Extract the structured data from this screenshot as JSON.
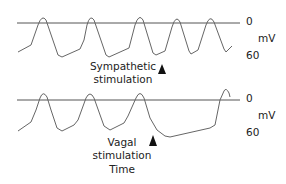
{
  "top_panel": {
    "label_line1": "Sympathetic",
    "label_line2": "stimulation",
    "axis_zero": "0",
    "axis_unit": "mV",
    "axis_low": "60"
  },
  "bottom_panel": {
    "label_line1": "Vagal",
    "label_line2": "stimulation",
    "axis_zero": "0",
    "axis_unit": "mV",
    "axis_low": "60"
  },
  "x_axis_label": "Time",
  "colors": {
    "trace": "#555555",
    "baseline": "#555555",
    "arrow": "#111111",
    "text": "#222222"
  }
}
